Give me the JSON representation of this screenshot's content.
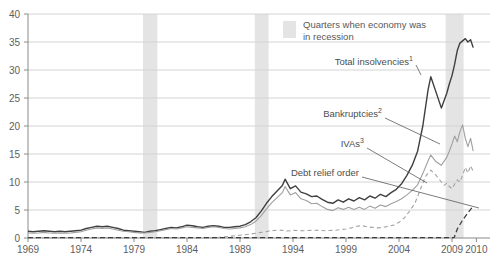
{
  "legend": {
    "label": "Quarters when economy was in recession"
  },
  "chart_data": {
    "type": "line",
    "title": "",
    "xlabel": "",
    "ylabel": "",
    "x_min": 1969,
    "x_max": 2012.6,
    "ylim": [
      0,
      40
    ],
    "grid": "horizontal",
    "legend_position": "top-right-inside",
    "y_ticks": [
      0,
      5,
      10,
      15,
      20,
      25,
      30,
      35,
      40
    ],
    "x_ticks": [
      {
        "label": "1969",
        "at": 1969
      },
      {
        "label": "1974",
        "at": 1974
      },
      {
        "label": "1979",
        "at": 1979
      },
      {
        "label": "1984",
        "at": 1984
      },
      {
        "label": "1989",
        "at": 1989
      },
      {
        "label": "1994",
        "at": 1994
      },
      {
        "label": "1999",
        "at": 1999
      },
      {
        "label": "2004",
        "at": 2004
      },
      {
        "label": "2009",
        "at": 2009
      },
      {
        "label": "2010",
        "at": 2011.3
      }
    ],
    "recessions": [
      [
        1979.85,
        1981.2
      ],
      [
        1990.4,
        1991.7
      ],
      [
        2008.4,
        2010.1
      ]
    ],
    "colors": {
      "recession_band": "#e4e4e4",
      "grid": "#d4d4d4",
      "axis": "#8a8a8a",
      "tick_text": "#5e5e5e",
      "leader": "#5a5a5a",
      "total": "#3f3f3f",
      "bankruptcies": "#9f9f9f",
      "ivas": "#a3a3a3",
      "dro": "#3f3f3f"
    },
    "series": [
      {
        "id": "total-insolvencies",
        "name": "Total insolvencies",
        "footnote": "1",
        "color": "#3f3f3f",
        "width": 1.4,
        "dash": "",
        "points": [
          [
            1969,
            1.2
          ],
          [
            1969.5,
            1.1
          ],
          [
            1970,
            1.2
          ],
          [
            1970.5,
            1.3
          ],
          [
            1971,
            1.2
          ],
          [
            1971.5,
            1.1
          ],
          [
            1972,
            1.2
          ],
          [
            1972.5,
            1.1
          ],
          [
            1973,
            1.2
          ],
          [
            1973.5,
            1.3
          ],
          [
            1974,
            1.4
          ],
          [
            1974.5,
            1.7
          ],
          [
            1975,
            1.9
          ],
          [
            1975.5,
            2.1
          ],
          [
            1976,
            2.0
          ],
          [
            1976.5,
            2.1
          ],
          [
            1977,
            1.9
          ],
          [
            1977.5,
            1.7
          ],
          [
            1978,
            1.4
          ],
          [
            1978.5,
            1.3
          ],
          [
            1979,
            1.2
          ],
          [
            1979.5,
            1.1
          ],
          [
            1980,
            1.0
          ],
          [
            1980.5,
            1.2
          ],
          [
            1981,
            1.3
          ],
          [
            1981.5,
            1.5
          ],
          [
            1982,
            1.7
          ],
          [
            1982.5,
            1.9
          ],
          [
            1983,
            1.8
          ],
          [
            1983.5,
            2.0
          ],
          [
            1984,
            2.3
          ],
          [
            1984.5,
            2.2
          ],
          [
            1985,
            2.0
          ],
          [
            1985.5,
            1.9
          ],
          [
            1986,
            2.1
          ],
          [
            1986.5,
            2.2
          ],
          [
            1987,
            2.1
          ],
          [
            1987.5,
            1.9
          ],
          [
            1988,
            1.9
          ],
          [
            1988.5,
            2.0
          ],
          [
            1989,
            2.1
          ],
          [
            1989.5,
            2.4
          ],
          [
            1990,
            2.9
          ],
          [
            1990.5,
            3.6
          ],
          [
            1991,
            4.8
          ],
          [
            1991.5,
            6.2
          ],
          [
            1992,
            7.4
          ],
          [
            1992.5,
            8.4
          ],
          [
            1993,
            9.4
          ],
          [
            1993.25,
            10.5
          ],
          [
            1993.75,
            8.8
          ],
          [
            1994.25,
            9.3
          ],
          [
            1994.75,
            8.2
          ],
          [
            1995.25,
            7.9
          ],
          [
            1995.75,
            7.4
          ],
          [
            1996.25,
            7.5
          ],
          [
            1996.75,
            6.9
          ],
          [
            1997.25,
            6.4
          ],
          [
            1997.75,
            6.2
          ],
          [
            1998.25,
            6.8
          ],
          [
            1998.75,
            6.4
          ],
          [
            1999.25,
            7.0
          ],
          [
            1999.75,
            6.6
          ],
          [
            2000.25,
            7.2
          ],
          [
            2000.75,
            6.8
          ],
          [
            2001.25,
            7.5
          ],
          [
            2001.75,
            7.1
          ],
          [
            2002.25,
            7.8
          ],
          [
            2002.75,
            7.4
          ],
          [
            2003.25,
            8.1
          ],
          [
            2003.75,
            8.7
          ],
          [
            2004.25,
            9.7
          ],
          [
            2004.75,
            11.2
          ],
          [
            2005.25,
            13.0
          ],
          [
            2005.75,
            15.5
          ],
          [
            2006.25,
            20.0
          ],
          [
            2006.75,
            26.5
          ],
          [
            2007,
            28.8
          ],
          [
            2007.5,
            26.0
          ],
          [
            2008,
            23.2
          ],
          [
            2008.5,
            25.8
          ],
          [
            2008.75,
            27.5
          ],
          [
            2009,
            29.0
          ],
          [
            2009.25,
            31.0
          ],
          [
            2009.5,
            33.5
          ],
          [
            2009.75,
            34.8
          ],
          [
            2010,
            35.2
          ],
          [
            2010.25,
            35.6
          ],
          [
            2010.5,
            35.0
          ],
          [
            2010.75,
            35.4
          ],
          [
            2011,
            34.0
          ]
        ]
      },
      {
        "id": "bankruptcies",
        "name": "Bankruptcies",
        "footnote": "2",
        "color": "#9f9f9f",
        "width": 1.1,
        "dash": "",
        "points": [
          [
            1969,
            0.9
          ],
          [
            1969.5,
            0.85
          ],
          [
            1970,
            0.9
          ],
          [
            1970.5,
            1.0
          ],
          [
            1971,
            0.9
          ],
          [
            1971.5,
            0.85
          ],
          [
            1972,
            0.9
          ],
          [
            1972.5,
            0.85
          ],
          [
            1973,
            0.9
          ],
          [
            1973.5,
            1.0
          ],
          [
            1974,
            1.1
          ],
          [
            1974.5,
            1.4
          ],
          [
            1975,
            1.6
          ],
          [
            1975.5,
            1.8
          ],
          [
            1976,
            1.7
          ],
          [
            1976.5,
            1.8
          ],
          [
            1977,
            1.6
          ],
          [
            1977.5,
            1.4
          ],
          [
            1978,
            1.2
          ],
          [
            1978.5,
            1.1
          ],
          [
            1979,
            1.0
          ],
          [
            1979.5,
            0.9
          ],
          [
            1980,
            0.9
          ],
          [
            1980.5,
            1.0
          ],
          [
            1981,
            1.1
          ],
          [
            1981.5,
            1.3
          ],
          [
            1982,
            1.5
          ],
          [
            1982.5,
            1.7
          ],
          [
            1983,
            1.6
          ],
          [
            1983.5,
            1.8
          ],
          [
            1984,
            2.0
          ],
          [
            1984.5,
            1.9
          ],
          [
            1985,
            1.8
          ],
          [
            1985.5,
            1.7
          ],
          [
            1986,
            1.9
          ],
          [
            1986.5,
            2.0
          ],
          [
            1987,
            1.9
          ],
          [
            1987.5,
            1.7
          ],
          [
            1988,
            1.6
          ],
          [
            1988.5,
            1.7
          ],
          [
            1989,
            1.8
          ],
          [
            1989.5,
            2.0
          ],
          [
            1990,
            2.4
          ],
          [
            1990.5,
            3.0
          ],
          [
            1991,
            4.0
          ],
          [
            1991.5,
            5.2
          ],
          [
            1992,
            6.3
          ],
          [
            1992.5,
            7.2
          ],
          [
            1993,
            8.1
          ],
          [
            1993.25,
            9.2
          ],
          [
            1993.75,
            7.7
          ],
          [
            1994.25,
            8.1
          ],
          [
            1994.75,
            7.0
          ],
          [
            1995.25,
            6.7
          ],
          [
            1995.75,
            6.1
          ],
          [
            1996.25,
            6.2
          ],
          [
            1996.75,
            5.6
          ],
          [
            1997.25,
            5.1
          ],
          [
            1997.75,
            4.9
          ],
          [
            1998.25,
            5.4
          ],
          [
            1998.75,
            5.1
          ],
          [
            1999.25,
            5.5
          ],
          [
            1999.75,
            5.1
          ],
          [
            2000.25,
            5.5
          ],
          [
            2000.75,
            5.1
          ],
          [
            2001.25,
            5.7
          ],
          [
            2001.75,
            5.3
          ],
          [
            2002.25,
            5.9
          ],
          [
            2002.75,
            5.6
          ],
          [
            2003.25,
            6.1
          ],
          [
            2003.75,
            6.5
          ],
          [
            2004.25,
            7.0
          ],
          [
            2004.75,
            7.7
          ],
          [
            2005.25,
            8.5
          ],
          [
            2005.75,
            9.5
          ],
          [
            2006.25,
            11.5
          ],
          [
            2006.75,
            13.8
          ],
          [
            2007,
            14.8
          ],
          [
            2007.5,
            13.6
          ],
          [
            2008,
            13.0
          ],
          [
            2008.5,
            14.4
          ],
          [
            2008.75,
            15.5
          ],
          [
            2009,
            16.8
          ],
          [
            2009.25,
            18.2
          ],
          [
            2009.5,
            17.2
          ],
          [
            2009.75,
            19.0
          ],
          [
            2010,
            20.2
          ],
          [
            2010.25,
            17.8
          ],
          [
            2010.5,
            16.3
          ],
          [
            2010.75,
            17.8
          ],
          [
            2011,
            15.5
          ]
        ]
      },
      {
        "id": "ivas",
        "name": "IVAs",
        "footnote": "3",
        "color": "#a3a3a3",
        "width": 1.1,
        "dash": "4,3",
        "points": [
          [
            1969,
            0.05
          ],
          [
            1986.5,
            0.05
          ],
          [
            1987,
            0.1
          ],
          [
            1988,
            0.3
          ],
          [
            1989,
            0.5
          ],
          [
            1990,
            0.7
          ],
          [
            1990.5,
            0.85
          ],
          [
            1991,
            1.0
          ],
          [
            1991.5,
            1.15
          ],
          [
            1992,
            1.3
          ],
          [
            1992.5,
            1.4
          ],
          [
            1993,
            1.35
          ],
          [
            1993.5,
            1.25
          ],
          [
            1994,
            1.35
          ],
          [
            1995,
            1.3
          ],
          [
            1996,
            1.4
          ],
          [
            1997,
            1.3
          ],
          [
            1998,
            1.4
          ],
          [
            1998.5,
            1.5
          ],
          [
            1999,
            1.6
          ],
          [
            1999.5,
            1.8
          ],
          [
            2000,
            2.1
          ],
          [
            2000.5,
            2.2
          ],
          [
            2001,
            2.0
          ],
          [
            2001.5,
            1.9
          ],
          [
            2002,
            1.8
          ],
          [
            2002.5,
            1.9
          ],
          [
            2003,
            2.1
          ],
          [
            2003.5,
            2.3
          ],
          [
            2004,
            2.8
          ],
          [
            2004.5,
            3.6
          ],
          [
            2005,
            4.8
          ],
          [
            2005.5,
            6.2
          ],
          [
            2006,
            8.6
          ],
          [
            2006.5,
            11.0
          ],
          [
            2007,
            12.1
          ],
          [
            2007.5,
            11.2
          ],
          [
            2008,
            10.0
          ],
          [
            2008.25,
            9.4
          ],
          [
            2008.5,
            9.8
          ],
          [
            2008.75,
            9.2
          ],
          [
            2009,
            8.8
          ],
          [
            2009.25,
            9.6
          ],
          [
            2009.5,
            10.4
          ],
          [
            2009.75,
            10.0
          ],
          [
            2010,
            11.2
          ],
          [
            2010.25,
            12.6
          ],
          [
            2010.5,
            11.6
          ],
          [
            2010.75,
            12.9
          ],
          [
            2011,
            11.9
          ]
        ]
      },
      {
        "id": "debt-relief-order",
        "name": "Debt relief order",
        "footnote": "",
        "color": "#3f3f3f",
        "width": 1.3,
        "dash": "5,3",
        "points": [
          [
            1969,
            0.05
          ],
          [
            2009.2,
            0.05
          ],
          [
            2009.5,
            1.6
          ],
          [
            2010,
            3.2
          ],
          [
            2010.5,
            4.5
          ],
          [
            2011,
            5.7
          ]
        ]
      }
    ],
    "annotations": [
      {
        "label": "Total insolvencies",
        "sup": "1",
        "text_end": [
          413,
          63
        ],
        "line": [
          416,
          65,
          421,
          75
        ]
      },
      {
        "label": "Bankruptcies",
        "sup": "2",
        "text_end": [
          382,
          115
        ],
        "line": [
          385,
          118,
          440,
          144
        ]
      },
      {
        "label": "IVAs",
        "sup": "3",
        "text_end": [
          364,
          145
        ],
        "line": [
          367,
          148,
          427,
          183
        ]
      },
      {
        "label": "Debt relief order",
        "sup": "",
        "text_end": [
          359,
          174
        ],
        "line": [
          362,
          177,
          479,
          208
        ]
      }
    ]
  }
}
